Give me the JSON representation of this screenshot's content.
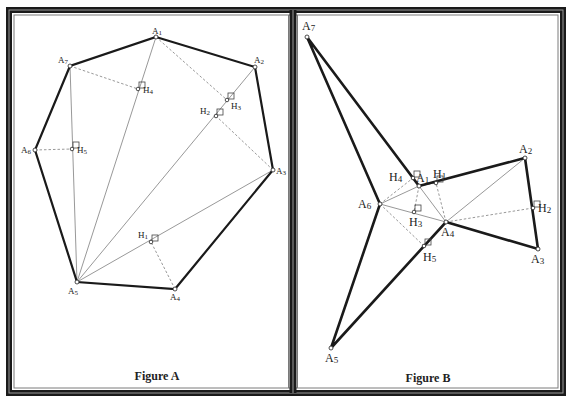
{
  "figures": [
    {
      "id": "A",
      "caption": "Figure A",
      "caption_pos": [
        157,
        380
      ],
      "vertices": {
        "A1": {
          "label": "A1",
          "xy": [
            156,
            37
          ],
          "label_xy": [
            152,
            34
          ]
        },
        "A2": {
          "label": "A2",
          "xy": [
            255,
            67
          ],
          "label_xy": [
            254,
            63
          ]
        },
        "A3": {
          "label": "A3",
          "xy": [
            273,
            170
          ],
          "label_xy": [
            276,
            174
          ]
        },
        "A4": {
          "label": "A4",
          "xy": [
            175,
            289
          ],
          "label_xy": [
            170,
            300
          ]
        },
        "A5": {
          "label": "A5",
          "xy": [
            77,
            282
          ],
          "label_xy": [
            68,
            294
          ]
        },
        "A6": {
          "label": "A6",
          "xy": [
            35,
            150
          ],
          "label_xy": [
            21,
            153
          ]
        },
        "A7": {
          "label": "A7",
          "xy": [
            70,
            66
          ],
          "label_xy": [
            58,
            63
          ]
        }
      },
      "feet": {
        "H1": {
          "label": "H1",
          "xy": [
            151,
            242
          ],
          "label_xy": [
            138,
            238
          ]
        },
        "H2": {
          "label": "H2",
          "xy": [
            216,
            116
          ],
          "label_xy": [
            200,
            114
          ]
        },
        "H3": {
          "label": "H3",
          "xy": [
            227,
            100
          ],
          "label_xy": [
            231,
            109
          ]
        },
        "H4": {
          "label": "H4",
          "xy": [
            138,
            89
          ],
          "label_xy": [
            143,
            93
          ]
        },
        "H5": {
          "label": "H5",
          "xy": [
            72,
            149
          ],
          "label_xy": [
            77,
            153
          ]
        }
      },
      "polygon": [
        "A1",
        "A2",
        "A3",
        "A4",
        "A5",
        "A6",
        "A7"
      ],
      "diagonals": [
        [
          "A5",
          "A1"
        ],
        [
          "A5",
          "A2"
        ],
        [
          "A5",
          "A3"
        ],
        [
          "A5",
          "A7"
        ]
      ],
      "altitudes": [
        [
          "A4",
          "H1"
        ],
        [
          "A3",
          "H2"
        ],
        [
          "A1",
          "H3"
        ],
        [
          "A7",
          "H4"
        ],
        [
          "A6",
          "H5"
        ]
      ]
    },
    {
      "id": "B",
      "caption": "Figure B",
      "caption_pos": [
        428,
        382
      ],
      "vertices": {
        "A1": {
          "label": "A1",
          "xy": [
            419,
            186
          ],
          "label_xy": [
            416,
            182
          ]
        },
        "A2": {
          "label": "A2",
          "xy": [
            525,
            158
          ],
          "label_xy": [
            519,
            153
          ]
        },
        "A3": {
          "label": "A3",
          "xy": [
            538,
            249
          ],
          "label_xy": [
            531,
            263
          ]
        },
        "A4": {
          "label": "A4",
          "xy": [
            446,
            222
          ],
          "label_xy": [
            441,
            236
          ]
        },
        "A5": {
          "label": "A5",
          "xy": [
            331,
            348
          ],
          "label_xy": [
            325,
            362
          ]
        },
        "A6": {
          "label": "A6",
          "xy": [
            380,
            204
          ],
          "label_xy": [
            358,
            208
          ]
        },
        "A7": {
          "label": "A7",
          "xy": [
            307,
            37
          ],
          "label_xy": [
            302,
            30
          ]
        }
      },
      "feet": {
        "H1": {
          "label": "H1",
          "xy": [
            436,
            183
          ],
          "label_xy": [
            433,
            178
          ]
        },
        "H2": {
          "label": "H2",
          "xy": [
            533,
            208
          ],
          "label_xy": [
            538,
            212
          ]
        },
        "H3": {
          "label": "H3",
          "xy": [
            414,
            212
          ],
          "label_xy": [
            409,
            226
          ]
        },
        "H4": {
          "label": "H4",
          "xy": [
            413,
            178
          ],
          "label_xy": [
            389,
            181
          ]
        },
        "H5": {
          "label": "H5",
          "xy": [
            424,
            246
          ],
          "label_xy": [
            423,
            261
          ]
        }
      },
      "polygon": [
        "A1",
        "A2",
        "A3",
        "A4",
        "A5",
        "A6",
        "A7"
      ],
      "diagonals": [
        [
          "A4",
          "A1"
        ],
        [
          "A4",
          "A2"
        ],
        [
          "A4",
          "A6"
        ],
        [
          "A6",
          "A1"
        ]
      ],
      "altitudes": [
        [
          "A1",
          "H1"
        ],
        [
          "A4",
          "H1"
        ],
        [
          "A4",
          "H2"
        ],
        [
          "A1",
          "H3"
        ],
        [
          "A6",
          "H4"
        ],
        [
          "A6",
          "H5"
        ]
      ]
    }
  ],
  "colors": {
    "frame_dark": "#1a1a1a",
    "frame_light": "#8a8a8a",
    "polygon_stroke": "#1a1a1a",
    "thin_line": "#8c8c8c",
    "dashed_line": "#8c8c8c",
    "background": "#ffffff"
  }
}
